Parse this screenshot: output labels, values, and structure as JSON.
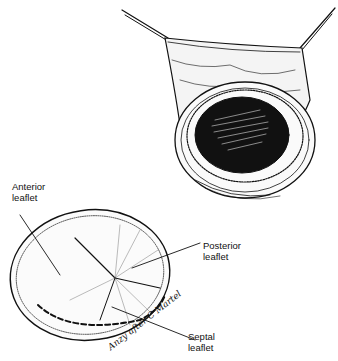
{
  "figure": {
    "panels": [
      {
        "id": "top",
        "description": "Right atrium opened with retractors exposing valve annulus"
      },
      {
        "id": "bottom",
        "description": "Tricuspid valve leaflets viewed en face"
      }
    ],
    "labels": {
      "anterior": {
        "line1": "Anterior",
        "line2": "leaflet"
      },
      "posterior": {
        "line1": "Posterior",
        "line2": "leaflet"
      },
      "septal": {
        "line1": "Septal",
        "line2": "leaflet"
      }
    },
    "signature": "Anzy after C Martel"
  }
}
